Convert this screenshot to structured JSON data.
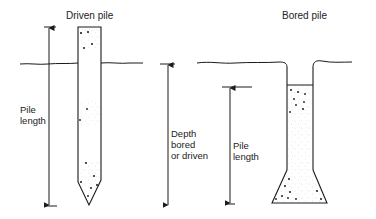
{
  "diagram": {
    "type": "engineering-comparison",
    "colors": {
      "line": "#1a1a1a",
      "fill": "#ffffff",
      "stipple": "#555555"
    }
  },
  "driven_pile": {
    "title": "Driven pile",
    "dimension_label_line1": "Pile",
    "dimension_label_line2": "length"
  },
  "middle_dimension": {
    "line1": "Depth",
    "line2": "bored",
    "line3": "or driven"
  },
  "bored_pile": {
    "title": "Bored pile",
    "dimension_label_line1": "Pile",
    "dimension_label_line2": "length"
  }
}
